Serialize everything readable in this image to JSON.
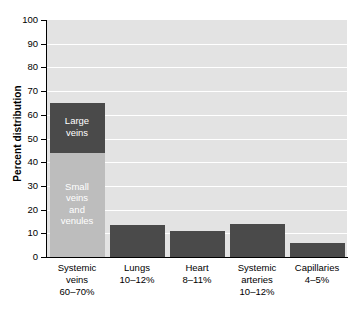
{
  "chart_data": {
    "type": "bar",
    "title": "",
    "xlabel": "",
    "ylabel": "Percent distribution",
    "ylim": [
      0,
      100
    ],
    "ytick_step": 10,
    "grid": true,
    "legend": "none",
    "stacked_first_bar": true,
    "categories": [
      "Systemic veins",
      "Lungs",
      "Heart",
      "Systemic arteries",
      "Capillaries"
    ],
    "values": [
      65,
      13.5,
      11,
      14,
      6
    ],
    "yticks": [
      "100",
      "90",
      "80",
      "70",
      "60",
      "50",
      "40",
      "30",
      "20",
      "10",
      "0"
    ],
    "colors": {
      "bar_dark": "#4a4a4a",
      "bar_light": "#bdbdbd",
      "plot_background": "#e3e3e3",
      "gridline": "#ffffff",
      "axis": "#000000",
      "text": "#000000",
      "segment_label": "#ffffff"
    },
    "bars": [
      {
        "name": "systemic-veins",
        "total": 65,
        "range_label": "60–70%",
        "category_label": "Systemic veins",
        "x_label_lines": [
          "Systemic",
          "veins",
          "60–70%"
        ],
        "segments": [
          {
            "name": "large-veins",
            "label_lines": [
              "Large",
              "veins"
            ],
            "label": "Large veins",
            "from": 44,
            "to": 65,
            "value": 21,
            "color": "#4a4a4a"
          },
          {
            "name": "small-veins-and-venules",
            "label_lines": [
              "Small",
              "veins",
              "and",
              "venules"
            ],
            "label": "Small veins and venules",
            "from": 0,
            "to": 44,
            "value": 44,
            "color": "#bdbdbd"
          }
        ]
      },
      {
        "name": "lungs",
        "total": 13.5,
        "range_label": "10–12%",
        "category_label": "Lungs",
        "x_label_lines": [
          "Lungs",
          "10–12%"
        ],
        "segments": [
          {
            "name": "lungs-bar",
            "label_lines": [],
            "label": "",
            "from": 0,
            "to": 13.5,
            "value": 13.5,
            "color": "#4a4a4a"
          }
        ]
      },
      {
        "name": "heart",
        "total": 11,
        "range_label": "8–11%",
        "category_label": "Heart",
        "x_label_lines": [
          "Heart",
          "8–11%"
        ],
        "segments": [
          {
            "name": "heart-bar",
            "label_lines": [],
            "label": "",
            "from": 0,
            "to": 11,
            "value": 11,
            "color": "#4a4a4a"
          }
        ]
      },
      {
        "name": "systemic-arteries",
        "total": 14,
        "range_label": "10–12%",
        "category_label": "Systemic arteries",
        "x_label_lines": [
          "Systemic",
          "arteries",
          "10–12%"
        ],
        "segments": [
          {
            "name": "systemic-arteries-bar",
            "label_lines": [],
            "label": "",
            "from": 0,
            "to": 14,
            "value": 14,
            "color": "#4a4a4a"
          }
        ]
      },
      {
        "name": "capillaries",
        "total": 6,
        "range_label": "4–5%",
        "category_label": "Capillaries",
        "x_label_lines": [
          "Capillaries",
          "4–5%"
        ],
        "segments": [
          {
            "name": "capillaries-bar",
            "label_lines": [],
            "label": "",
            "from": 0,
            "to": 6,
            "value": 6,
            "color": "#4a4a4a"
          }
        ]
      }
    ]
  }
}
